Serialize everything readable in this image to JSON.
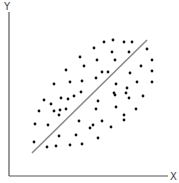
{
  "chart_data": {
    "type": "scatter",
    "title": "",
    "xlabel": "X",
    "ylabel": "Y",
    "grid": false,
    "legend": null,
    "xlim": [
      0,
      179
    ],
    "ylim": [
      0,
      176
    ],
    "trendline": {
      "x1": 32,
      "y1": 153,
      "x2": 147,
      "y2": 40,
      "color": "#8a8a8a"
    },
    "point_color": "#111111",
    "axis_color": "#555555",
    "points": [
      [
        104,
        42
      ],
      [
        113,
        40
      ],
      [
        124,
        42
      ],
      [
        132,
        42
      ],
      [
        94,
        48
      ],
      [
        112,
        52
      ],
      [
        129,
        52
      ],
      [
        147,
        49
      ],
      [
        80,
        57
      ],
      [
        97,
        60
      ],
      [
        115,
        60
      ],
      [
        152,
        60
      ],
      [
        84,
        66
      ],
      [
        66,
        70
      ],
      [
        141,
        66
      ],
      [
        152,
        71
      ],
      [
        102,
        72
      ],
      [
        108,
        72
      ],
      [
        96,
        78
      ],
      [
        130,
        73
      ],
      [
        152,
        82
      ],
      [
        70,
        82
      ],
      [
        82,
        81
      ],
      [
        54,
        84
      ],
      [
        116,
        84
      ],
      [
        137,
        82
      ],
      [
        115,
        95
      ],
      [
        127,
        88
      ],
      [
        143,
        96
      ],
      [
        114,
        93
      ],
      [
        61,
        98
      ],
      [
        68,
        99
      ],
      [
        74,
        96
      ],
      [
        81,
        92
      ],
      [
        126,
        93
      ],
      [
        129,
        98
      ],
      [
        98,
        101
      ],
      [
        44,
        100
      ],
      [
        51,
        104
      ],
      [
        60,
        110
      ],
      [
        66,
        109
      ],
      [
        96,
        109
      ],
      [
        116,
        107
      ],
      [
        136,
        109
      ],
      [
        54,
        111
      ],
      [
        59,
        115
      ],
      [
        39,
        111
      ],
      [
        124,
        115
      ],
      [
        35,
        124
      ],
      [
        48,
        125
      ],
      [
        79,
        121
      ],
      [
        102,
        121
      ],
      [
        93,
        125
      ],
      [
        90,
        128
      ],
      [
        111,
        127
      ],
      [
        124,
        120
      ],
      [
        59,
        136
      ],
      [
        76,
        135
      ],
      [
        98,
        138
      ],
      [
        82,
        144
      ],
      [
        34,
        142
      ],
      [
        47,
        147
      ],
      [
        56,
        146
      ],
      [
        70,
        145
      ]
    ]
  }
}
